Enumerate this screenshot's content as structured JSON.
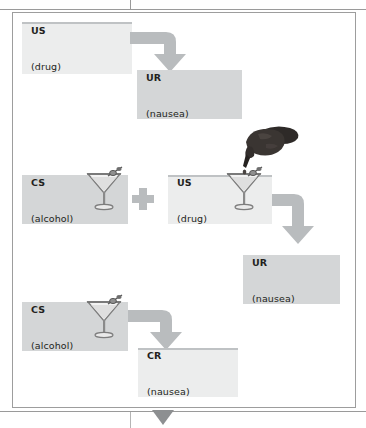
{
  "figure": {
    "frame_color": "#9d9d9d",
    "box_fill_light": "#eceded",
    "box_fill_dark": "#d4d6d7",
    "arrow_color": "#b9bcbe",
    "text_color": "#231f20"
  },
  "rows": [
    {
      "id": "row-1",
      "boxes": [
        {
          "name": "us-drug-box-1",
          "line1": "US",
          "line2": "(drug)",
          "shade": "light",
          "has_glass": false
        },
        {
          "name": "ur-nausea-box-1",
          "line1": "UR",
          "line2": "(nausea)",
          "shade": "dark",
          "has_glass": false
        }
      ],
      "connector": "elbow-right-down"
    },
    {
      "id": "row-2",
      "boxes": [
        {
          "name": "cs-alcohol-box-1",
          "line1": "CS",
          "line2": "(alcohol)",
          "shade": "dark",
          "has_glass": true
        },
        {
          "name": "us-drug-box-2",
          "line1": "US",
          "line2": "(drug)",
          "shade": "light",
          "has_glass": true
        },
        {
          "name": "ur-nausea-box-2",
          "line1": "UR",
          "line2": "(nausea)",
          "shade": "dark",
          "has_glass": false
        }
      ],
      "operator": "+",
      "connector": "elbow-right-down"
    },
    {
      "id": "row-3",
      "boxes": [
        {
          "name": "cs-alcohol-box-2",
          "line1": "CS",
          "line2": "(alcohol)",
          "shade": "dark",
          "has_glass": true
        },
        {
          "name": "cr-nausea-box",
          "line1": "CR",
          "line2": "(nausea)",
          "shade": "light",
          "has_glass": false
        }
      ],
      "connector": "elbow-right-down"
    }
  ],
  "icons": {
    "martini_glass": "martini-glass-icon",
    "hand_dropper": "hand-with-dropper-icon",
    "plus": "plus-sign-icon",
    "elbow_arrow": "elbow-arrow-icon",
    "page_arrow": "triangle-down-icon"
  },
  "labels": {
    "us_1_line1": "US",
    "us_1_line2": "(drug)",
    "ur_1_line1": "UR",
    "ur_1_line2": "(nausea)",
    "cs_1_line1": "CS",
    "cs_1_line2": "(alcohol)",
    "us_2_line1": "US",
    "us_2_line2": "(drug)",
    "ur_2_line1": "UR",
    "ur_2_line2": "(nausea)",
    "cs_2_line1": "CS",
    "cs_2_line2": "(alcohol)",
    "cr_line1": "CR",
    "cr_line2": "(nausea)",
    "plus_sign": "+"
  }
}
